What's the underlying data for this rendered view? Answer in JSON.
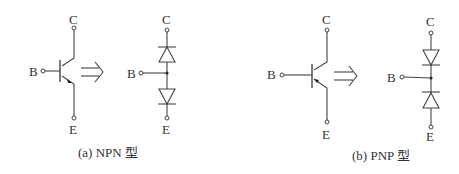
{
  "figure": {
    "panels": [
      {
        "id": "a",
        "caption": "(a) NPN 型",
        "transistor": {
          "type": "NPN",
          "terminals": {
            "collector": "C",
            "base": "B",
            "emitter": "E"
          }
        },
        "equivalence_arrow": "⇒",
        "diode_model": {
          "terminals": {
            "collector": "C",
            "base": "B",
            "emitter": "E"
          },
          "upper_diode": "anode at B node, cathode toward C",
          "lower_diode": "anode at B node, cathode toward E"
        }
      },
      {
        "id": "b",
        "caption": "(b) PNP 型",
        "transistor": {
          "type": "PNP",
          "terminals": {
            "collector": "C",
            "base": "B",
            "emitter": "E"
          }
        },
        "equivalence_arrow": "⇒",
        "diode_model": {
          "terminals": {
            "collector": "C",
            "base": "B",
            "emitter": "E"
          },
          "upper_diode": "anode toward C, cathode at B node",
          "lower_diode": "anode toward E, cathode at B node"
        }
      }
    ],
    "colors": {
      "line": "#444444",
      "text": "#333333",
      "background": "#ffffff"
    }
  }
}
